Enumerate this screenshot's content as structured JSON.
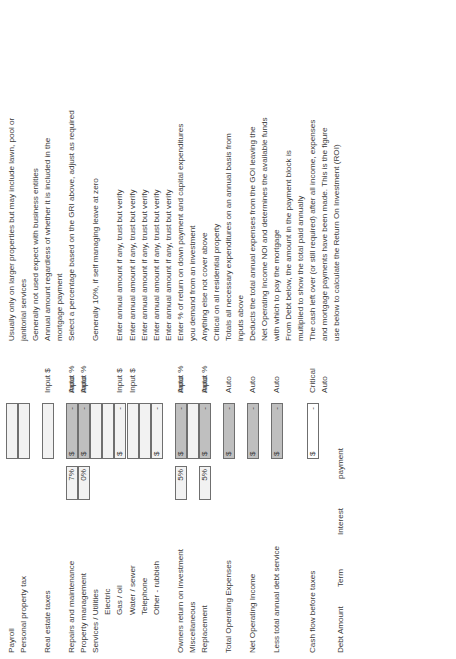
{
  "document": {
    "title": "Rental Property Operating Expense & Cash Flow Worksheet",
    "orientation": "rotated-90-ccw"
  },
  "columns": {
    "label": "Item",
    "percent": "Percent",
    "amount": "Amount",
    "kind": "Entry type",
    "description": "Description"
  },
  "kinds": {
    "auto": "Auto",
    "input_pct": "Input %",
    "input_amt": "Input $",
    "critical": "Critical"
  },
  "rows": [
    {
      "label": "Payroll",
      "indent": false,
      "percent": "",
      "currency": "",
      "amount": "",
      "kind": "",
      "description": "Usually only on larger properties but may include lawn, pool or",
      "box": "light",
      "pct_box": "none"
    },
    {
      "label": "Personal property tax",
      "indent": false,
      "percent": "",
      "currency": "",
      "amount": "",
      "kind": "",
      "description": "janitorial services",
      "box": "light",
      "pct_box": "none"
    },
    {
      "label": "",
      "indent": false,
      "percent": "",
      "currency": "",
      "amount": "",
      "kind": "",
      "description": "Generally not used expect with business entities",
      "box": "none",
      "pct_box": "none"
    },
    {
      "label": "Real estate taxes",
      "indent": false,
      "percent": "",
      "currency": "",
      "amount": "",
      "kind": "Input $",
      "description": "Annual amount regardless of whether it is included in the",
      "box": "light",
      "pct_box": "none"
    },
    {
      "label": "",
      "indent": false,
      "percent": "",
      "currency": "",
      "amount": "",
      "kind": "",
      "description": "mortgage payment",
      "box": "none",
      "pct_box": "none"
    },
    {
      "label": "Repairs and maintenance",
      "indent": false,
      "percent": "7%",
      "currency": "$",
      "amount": "-",
      "kind": "Input %",
      "description": "Select a percentage based on the GRI above, adjust as required",
      "box": "shaded",
      "pct_box": "light",
      "auto": "Auto"
    },
    {
      "label": "Property management",
      "indent": false,
      "percent": "0%",
      "currency": "$",
      "amount": "-",
      "kind": "Input %",
      "description": "",
      "box": "shaded",
      "pct_box": "light",
      "auto": "Auto"
    },
    {
      "label": "Services / Utilities",
      "indent": false,
      "percent": "",
      "currency": "",
      "amount": "",
      "kind": "",
      "description": "Generally 10%, if self managing leave at zero",
      "box": "light",
      "pct_box": "none"
    },
    {
      "label": "Electric",
      "indent": true,
      "percent": "",
      "currency": "",
      "amount": "",
      "kind": "",
      "description": "",
      "box": "light",
      "pct_box": "none"
    },
    {
      "label": "Gas / oil",
      "indent": true,
      "percent": "",
      "currency": "$",
      "amount": "-",
      "kind": "Input $",
      "description": "Enter annual amount if any, trust but verify",
      "box": "light",
      "pct_box": "none"
    },
    {
      "label": "Water / sewer",
      "indent": true,
      "percent": "",
      "currency": "",
      "amount": "",
      "kind": "Input $",
      "description": "Enter annual amount if any, trust but verify",
      "box": "light",
      "pct_box": "none"
    },
    {
      "label": "Telephone",
      "indent": true,
      "percent": "",
      "currency": "",
      "amount": "",
      "kind": "",
      "description": "Enter annual amount if any, trust but verify",
      "box": "light",
      "pct_box": "none"
    },
    {
      "label": "Other - rubbish",
      "indent": true,
      "percent": "",
      "currency": "$",
      "amount": "-",
      "kind": "",
      "description": "Enter annual amount if any, trust but verify",
      "box": "light",
      "pct_box": "none"
    },
    {
      "label": "",
      "indent": false,
      "percent": "",
      "currency": "",
      "amount": "",
      "kind": "",
      "description": "Enter annual amount if any, trust but verify",
      "box": "none",
      "pct_box": "none"
    },
    {
      "label": "Owners return on investment",
      "indent": false,
      "percent": "5%",
      "currency": "$",
      "amount": "-",
      "kind": "Input %",
      "description": "Enter % of return on down payment and capital expenditures",
      "box": "shaded",
      "pct_box": "light",
      "auto": "Auto"
    },
    {
      "label": "Miscellaneous",
      "indent": false,
      "percent": "",
      "currency": "",
      "amount": "",
      "kind": "",
      "description": "you demand from an investment",
      "box": "light",
      "pct_box": "none"
    },
    {
      "label": "Replacement",
      "indent": false,
      "percent": "5%",
      "currency": "$",
      "amount": "-",
      "kind": "Input %",
      "description": "Anything else not cover above",
      "box": "shaded",
      "pct_box": "light",
      "auto": "Auto"
    },
    {
      "label": "",
      "indent": false,
      "percent": "",
      "currency": "",
      "amount": "",
      "kind": "",
      "description": "Critical on all residential property",
      "box": "none",
      "pct_box": "none"
    },
    {
      "label": "Total Operating Expenses",
      "indent": false,
      "percent": "",
      "currency": "$",
      "amount": "-",
      "kind": "Auto",
      "description": "Totals all necessary expenditures on an annual basis from",
      "box": "shaded",
      "pct_box": "none"
    },
    {
      "label": "",
      "indent": false,
      "percent": "",
      "currency": "",
      "amount": "",
      "kind": "",
      "description": "inputs above",
      "box": "none",
      "pct_box": "none"
    },
    {
      "label": "Net Operating Income",
      "indent": false,
      "percent": "",
      "currency": "$",
      "amount": "-",
      "kind": "Auto",
      "description": "Deducts the total annual expenses from the GOI leaving the",
      "box": "shaded",
      "pct_box": "none"
    },
    {
      "label": "",
      "indent": false,
      "percent": "",
      "currency": "",
      "amount": "",
      "kind": "",
      "description": "Net Operating Income NOI and determines the available funds",
      "box": "none",
      "pct_box": "none"
    },
    {
      "label": "Less total annual debt service",
      "indent": false,
      "percent": "",
      "currency": "$",
      "amount": "-",
      "kind": "Auto",
      "description": "with which to pay the mortgage",
      "box": "shaded",
      "pct_box": "none"
    },
    {
      "label": "",
      "indent": false,
      "percent": "",
      "currency": "",
      "amount": "",
      "kind": "",
      "description": "From Debt below, the amount in the payment block is",
      "box": "none",
      "pct_box": "none"
    },
    {
      "label": "",
      "indent": false,
      "percent": "",
      "currency": "",
      "amount": "",
      "kind": "",
      "description": "multiplied to show the total paid annually",
      "box": "none",
      "pct_box": "none"
    },
    {
      "label": "Cash flow before taxes",
      "indent": false,
      "percent": "",
      "currency": "$",
      "amount": "-",
      "kind": "Critical",
      "description": "The cash left over (or still required) after all income, expenses",
      "box": "plain",
      "pct_box": "none"
    },
    {
      "label": "",
      "indent": false,
      "percent": "",
      "currency": "",
      "amount": "",
      "kind": "Auto",
      "description": "and mortgage payments have been made.  This is the figure",
      "box": "none",
      "pct_box": "none"
    },
    {
      "label": "",
      "indent": false,
      "percent": "",
      "currency": "",
      "amount": "",
      "kind": "",
      "description": "use below to calculate the Return On Investment (ROI)",
      "box": "none",
      "pct_box": "none"
    }
  ],
  "debt_block": {
    "heading": "Debt",
    "fields": [
      {
        "label": "Debt  Amount"
      },
      {
        "label": "Term"
      },
      {
        "label": "Interest"
      },
      {
        "label": "payment"
      }
    ]
  }
}
